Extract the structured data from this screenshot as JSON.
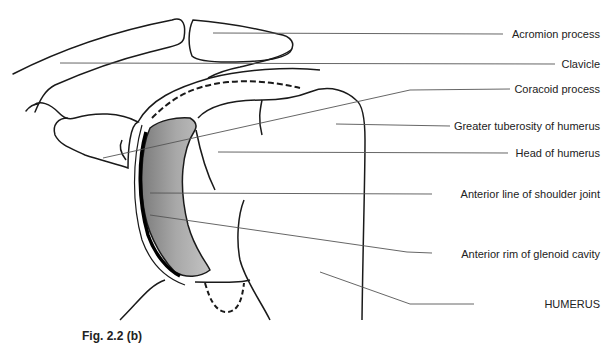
{
  "diagram": {
    "type": "anatomical-line-drawing",
    "caption": "Fig. 2.2 (b)",
    "labels": [
      {
        "id": "acromion",
        "text": "Acromion process",
        "y": 34
      },
      {
        "id": "clavicle",
        "text": "Clavicle",
        "y": 64
      },
      {
        "id": "coracoid",
        "text": "Coracoid process",
        "y": 89
      },
      {
        "id": "greater-tuberosity",
        "text": "Greater tuberosity of humerus",
        "y": 126
      },
      {
        "id": "head-humerus",
        "text": "Head of humerus",
        "y": 153
      },
      {
        "id": "anterior-line",
        "text": "Anterior line of shoulder joint",
        "y": 194
      },
      {
        "id": "glenoid-rim",
        "text": "Anterior rim of glenoid cavity",
        "y": 254
      },
      {
        "id": "humerus",
        "text": "HUMERUS",
        "y": 304
      }
    ],
    "colors": {
      "line": "#1a1a1a",
      "leader": "#555555",
      "glenoid_shading": "#9a9a9a",
      "background": "#ffffff"
    }
  }
}
